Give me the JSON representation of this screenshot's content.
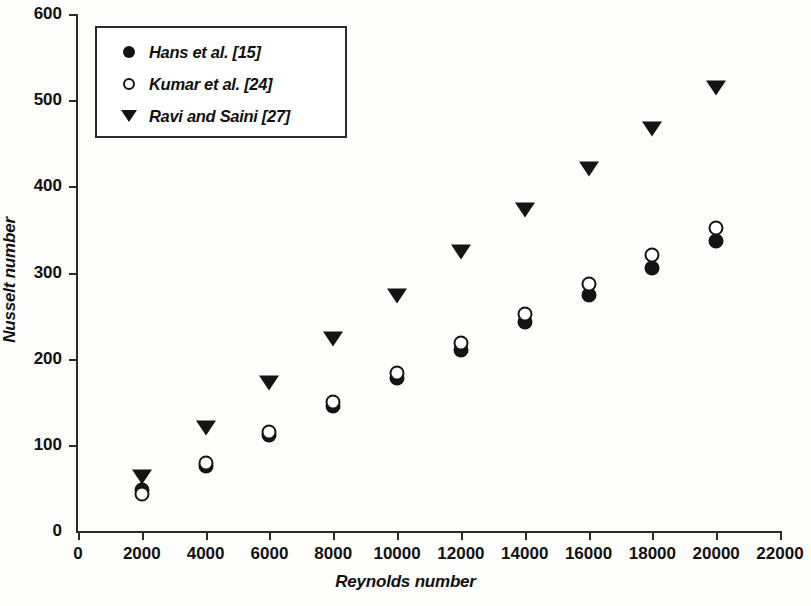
{
  "chart_data": {
    "type": "scatter",
    "title": "",
    "xlabel": "Reynolds number",
    "ylabel": "Nusselt number",
    "xlim": [
      0,
      22000
    ],
    "ylim": [
      0,
      600
    ],
    "xticks": [
      0,
      2000,
      4000,
      6000,
      8000,
      10000,
      12000,
      14000,
      16000,
      18000,
      20000,
      22000
    ],
    "yticks": [
      0,
      100,
      200,
      300,
      400,
      500,
      600
    ],
    "grid": false,
    "legend_position": "upper-left",
    "x": [
      2000,
      4000,
      6000,
      8000,
      10000,
      12000,
      14000,
      16000,
      18000,
      20000
    ],
    "series": [
      {
        "name": "Hans et al. [15]",
        "marker": "filled-circle",
        "color": "#141414",
        "values": [
          48,
          75,
          111,
          145,
          177,
          210,
          242,
          274,
          305,
          337
        ]
      },
      {
        "name": "Kumar et al. [24]",
        "marker": "open-circle",
        "color": "#141414",
        "values": [
          43,
          79,
          115,
          150,
          183,
          218,
          252,
          287,
          320,
          352
        ]
      },
      {
        "name": "Ravi and Saini [27]",
        "marker": "filled-triangle-down",
        "color": "#141414",
        "values": [
          63,
          119,
          172,
          223,
          273,
          324,
          372,
          420,
          466,
          514
        ]
      }
    ]
  }
}
